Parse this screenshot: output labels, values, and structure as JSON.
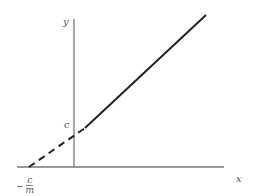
{
  "diagram": {
    "axes": {
      "x_label": "x",
      "y_label": "y"
    },
    "intercepts": {
      "y_intercept_label": "c",
      "x_intercept_label_sign": "−",
      "x_intercept_label_numerator": "c",
      "x_intercept_label_denominator": "m"
    },
    "colors": {
      "axis": "#777777",
      "line": "#222222",
      "label": "#555555"
    }
  }
}
